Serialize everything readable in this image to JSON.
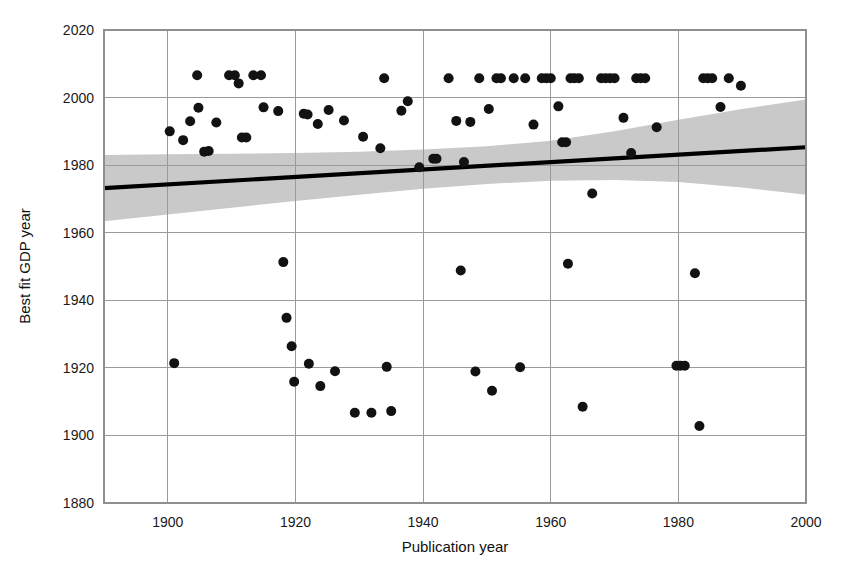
{
  "chart_data": {
    "type": "scatter",
    "title": "",
    "xlabel": "Publication year",
    "ylabel": "Best fit GDP year",
    "xlim": [
      1890,
      2000
    ],
    "ylim": [
      1880,
      2020
    ],
    "xticks": [
      1900,
      1920,
      1940,
      1960,
      1980,
      2000
    ],
    "xtick_labels": [
      "1900",
      "1920",
      "1940",
      "1960",
      "1980",
      "2000"
    ],
    "yticks": [
      1880,
      1900,
      1920,
      1940,
      1960,
      1980,
      2000,
      2020
    ],
    "ytick_labels": [
      "1880",
      "1900",
      "1920",
      "1940",
      "1960",
      "1980",
      "2000",
      "2020"
    ],
    "grid": true,
    "legend": "none",
    "marker_color": "#121212",
    "fit_line_color": "#000000",
    "ci_band_color": "#c9c9c9",
    "fit_line": {
      "label": "linear regression fit",
      "x_start": 1890,
      "y_start": 1973.2,
      "x_end": 2000,
      "y_end": 1985.3
    },
    "ci_band": {
      "label": "confidence interval",
      "x": [
        1890,
        1900,
        1910,
        1920,
        1930,
        1940,
        1950,
        1960,
        1970,
        1980,
        1990,
        2000
      ],
      "upper": [
        1983.0,
        1983.2,
        1983.4,
        1983.6,
        1984.0,
        1984.6,
        1985.6,
        1987.2,
        1990.0,
        1993.4,
        1996.6,
        1999.4
      ],
      "lower": [
        1963.4,
        1965.4,
        1967.4,
        1969.4,
        1971.2,
        1973.0,
        1974.4,
        1975.4,
        1975.6,
        1975.0,
        1973.4,
        1971.2
      ]
    },
    "points": [
      {
        "x": 1900.3,
        "y": 1990.0
      },
      {
        "x": 1901.0,
        "y": 1921.4
      },
      {
        "x": 1902.4,
        "y": 1987.4
      },
      {
        "x": 1903.5,
        "y": 1993.0
      },
      {
        "x": 1904.6,
        "y": 2006.6
      },
      {
        "x": 1904.8,
        "y": 1997.0
      },
      {
        "x": 1905.7,
        "y": 1984.0
      },
      {
        "x": 1906.4,
        "y": 1984.2
      },
      {
        "x": 1907.6,
        "y": 1992.6
      },
      {
        "x": 1909.6,
        "y": 2006.6
      },
      {
        "x": 1910.5,
        "y": 2006.6
      },
      {
        "x": 1911.1,
        "y": 2004.2
      },
      {
        "x": 1911.6,
        "y": 1988.2
      },
      {
        "x": 1912.3,
        "y": 1988.2
      },
      {
        "x": 1913.4,
        "y": 2006.6
      },
      {
        "x": 1914.6,
        "y": 2006.6
      },
      {
        "x": 1915.0,
        "y": 1997.1
      },
      {
        "x": 1917.3,
        "y": 1996.0
      },
      {
        "x": 1918.1,
        "y": 1951.3
      },
      {
        "x": 1918.6,
        "y": 1934.8
      },
      {
        "x": 1919.4,
        "y": 1926.4
      },
      {
        "x": 1919.8,
        "y": 1915.9
      },
      {
        "x": 1921.3,
        "y": 1995.2
      },
      {
        "x": 1921.9,
        "y": 1995.0
      },
      {
        "x": 1922.1,
        "y": 1921.2
      },
      {
        "x": 1923.5,
        "y": 1992.2
      },
      {
        "x": 1923.9,
        "y": 1914.6
      },
      {
        "x": 1925.2,
        "y": 1996.3
      },
      {
        "x": 1926.2,
        "y": 1919.0
      },
      {
        "x": 1927.6,
        "y": 1993.2
      },
      {
        "x": 1929.3,
        "y": 1906.7
      },
      {
        "x": 1930.6,
        "y": 1988.4
      },
      {
        "x": 1931.9,
        "y": 1906.7
      },
      {
        "x": 1933.3,
        "y": 1985.0
      },
      {
        "x": 1933.9,
        "y": 2005.7
      },
      {
        "x": 1934.3,
        "y": 1920.3
      },
      {
        "x": 1935.0,
        "y": 1907.2
      },
      {
        "x": 1936.6,
        "y": 1996.1
      },
      {
        "x": 1937.6,
        "y": 1998.9
      },
      {
        "x": 1939.4,
        "y": 1979.4
      },
      {
        "x": 1941.6,
        "y": 1981.9
      },
      {
        "x": 1942.1,
        "y": 1981.9
      },
      {
        "x": 1944.0,
        "y": 2005.7
      },
      {
        "x": 1945.2,
        "y": 1993.1
      },
      {
        "x": 1945.9,
        "y": 1948.8
      },
      {
        "x": 1946.4,
        "y": 1980.9
      },
      {
        "x": 1947.4,
        "y": 1992.8
      },
      {
        "x": 1948.2,
        "y": 1918.9
      },
      {
        "x": 1948.8,
        "y": 2005.7
      },
      {
        "x": 1950.3,
        "y": 1996.6
      },
      {
        "x": 1950.8,
        "y": 1913.2
      },
      {
        "x": 1951.5,
        "y": 2005.7
      },
      {
        "x": 1952.2,
        "y": 2005.7
      },
      {
        "x": 1954.2,
        "y": 2005.7
      },
      {
        "x": 1955.2,
        "y": 1920.2
      },
      {
        "x": 1956.0,
        "y": 2005.7
      },
      {
        "x": 1957.3,
        "y": 1992.0
      },
      {
        "x": 1958.6,
        "y": 2005.7
      },
      {
        "x": 1959.3,
        "y": 2005.7
      },
      {
        "x": 1960.0,
        "y": 2005.7
      },
      {
        "x": 1961.2,
        "y": 1997.4
      },
      {
        "x": 1961.8,
        "y": 1986.8
      },
      {
        "x": 1962.4,
        "y": 1986.8
      },
      {
        "x": 1962.7,
        "y": 1950.8
      },
      {
        "x": 1963.1,
        "y": 2005.7
      },
      {
        "x": 1963.7,
        "y": 2005.7
      },
      {
        "x": 1964.4,
        "y": 2005.7
      },
      {
        "x": 1965.0,
        "y": 1908.5
      },
      {
        "x": 1966.5,
        "y": 1971.6
      },
      {
        "x": 1967.9,
        "y": 2005.7
      },
      {
        "x": 1968.6,
        "y": 2005.7
      },
      {
        "x": 1969.3,
        "y": 2005.7
      },
      {
        "x": 1970.0,
        "y": 2005.7
      },
      {
        "x": 1971.4,
        "y": 1994.0
      },
      {
        "x": 1972.6,
        "y": 1983.6
      },
      {
        "x": 1973.4,
        "y": 2005.7
      },
      {
        "x": 1974.1,
        "y": 2005.7
      },
      {
        "x": 1974.8,
        "y": 2005.7
      },
      {
        "x": 1976.6,
        "y": 1991.2
      },
      {
        "x": 1979.7,
        "y": 1920.6
      },
      {
        "x": 1980.3,
        "y": 1920.6
      },
      {
        "x": 1981.0,
        "y": 1920.6
      },
      {
        "x": 1982.6,
        "y": 1948.0
      },
      {
        "x": 1983.3,
        "y": 1902.8
      },
      {
        "x": 1983.9,
        "y": 2005.7
      },
      {
        "x": 1984.6,
        "y": 2005.7
      },
      {
        "x": 1985.3,
        "y": 2005.7
      },
      {
        "x": 1986.6,
        "y": 1997.2
      },
      {
        "x": 1987.9,
        "y": 2005.7
      },
      {
        "x": 1989.8,
        "y": 2003.5
      }
    ]
  },
  "figure": {
    "xlabel": "Publication year",
    "ylabel": "Best fit GDP year"
  }
}
